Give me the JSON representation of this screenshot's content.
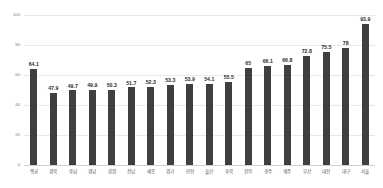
{
  "chart_data": {
    "type": "bar",
    "title": "",
    "subtitle": "",
    "xlabel": "",
    "ylabel": "",
    "ylim": [
      0,
      100
    ],
    "yticks": [
      "0",
      "20",
      "40",
      "60",
      "80",
      "100"
    ],
    "ytick_values": [
      0,
      20,
      40,
      60,
      80,
      100
    ],
    "grid": true,
    "legend": false,
    "legend_position": "none",
    "bar_color": "#3f3f3f",
    "gridline_color": "#e9e9e9",
    "label_color": "#2b2b2b",
    "background_color": "#ffffff",
    "categories": [
      "평균",
      "경북",
      "충남",
      "경남",
      "강원",
      "전남",
      "세종",
      "경기",
      "인천",
      "울산",
      "충북",
      "전북",
      "광주",
      "제주",
      "부산",
      "대전",
      "대구",
      "서울"
    ],
    "values": [
      64.1,
      47.9,
      49.7,
      49.9,
      50.3,
      51.7,
      52.3,
      53.3,
      53.9,
      54.1,
      55.5,
      65,
      66.1,
      66.8,
      72.8,
      75.5,
      78,
      93.9
    ],
    "value_labels": [
      "64.1",
      "47.9",
      "49.7",
      "49.9",
      "50.3",
      "51.7",
      "52.3",
      "53.3",
      "53.9",
      "54.1",
      "55.5",
      "65",
      "66.1",
      "66.8",
      "72.8",
      "75.5",
      "78",
      "93.9"
    ],
    "series": [
      {
        "name": "",
        "values": [
          64.1,
          47.9,
          49.7,
          49.9,
          50.3,
          51.7,
          52.3,
          53.3,
          53.9,
          54.1,
          55.5,
          65,
          66.1,
          66.8,
          72.8,
          75.5,
          78,
          93.9
        ]
      }
    ]
  }
}
